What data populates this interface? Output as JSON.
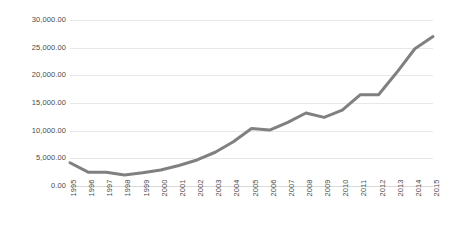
{
  "chart_data": {
    "type": "line",
    "title": "",
    "subtitle": "",
    "xlabel": "",
    "ylabel": "",
    "legend": [],
    "legend_position": "none",
    "grid": true,
    "grid_axis": "y",
    "xlim_categories": [
      "1995",
      "2015"
    ],
    "ylim": [
      0,
      30000
    ],
    "ytick_interval": 5000,
    "ytick_labels": [
      "0.00",
      "5,000.00",
      "10,000.00",
      "15,000.00",
      "20,000.00",
      "25,000.00",
      "30,000.00"
    ],
    "ytick_values": [
      0,
      5000,
      10000,
      15000,
      20000,
      25000,
      30000
    ],
    "categories": [
      "1995",
      "1996",
      "1997",
      "1998",
      "1999",
      "2000",
      "2001",
      "2002",
      "2003",
      "2004",
      "2005",
      "2006",
      "2007",
      "2008",
      "2009",
      "2010",
      "2011",
      "2012",
      "2013",
      "2014",
      "2015"
    ],
    "xtick_rotation": -90,
    "series": [
      {
        "name": "Series 1",
        "color": "#808080",
        "line_width": 3,
        "marker": "none",
        "values": [
          4200,
          2500,
          2500,
          2000,
          2400,
          2900,
          3700,
          4700,
          6100,
          8000,
          10400,
          10100,
          11500,
          13200,
          12400,
          13700,
          16500,
          16500,
          20500,
          24800,
          27000
        ]
      }
    ]
  },
  "axes": {
    "y_axis_name": "y-axis",
    "x_axis_name": "x-axis"
  }
}
